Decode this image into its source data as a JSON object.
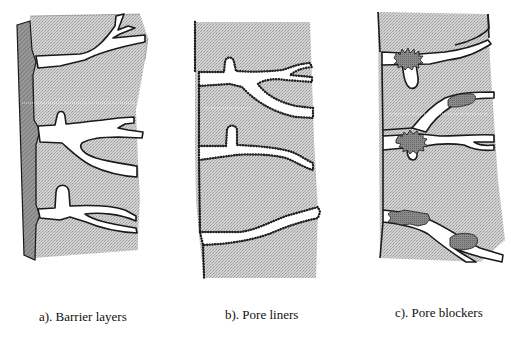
{
  "figure": {
    "panels": [
      {
        "id": "a",
        "caption": "a). Barrier layers",
        "description": "Coating layer on the outer surface blocking pore openings"
      },
      {
        "id": "b",
        "caption": "b). Pore liners",
        "description": "Pore walls lined with a thin particulate coating"
      },
      {
        "id": "c",
        "caption": "c). Pore blockers",
        "description": "Particles lodged inside pores blocking them"
      }
    ]
  },
  "colors": {
    "substrate_fill": "#c8c8c8",
    "barrier_layer": "#8a8a8a",
    "blocker_fill": "#7d7d7d",
    "outline": "#1a1a1a",
    "pore": "#ffffff"
  }
}
